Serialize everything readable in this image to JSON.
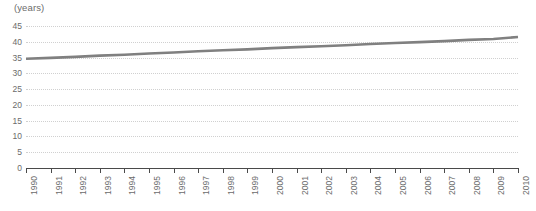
{
  "chart_data": {
    "type": "line",
    "title": "",
    "subtitle": "",
    "xlabel": "",
    "ylabel": "(years)",
    "unit_label": "(years)",
    "grid": true,
    "legend": false,
    "legend_position": "none",
    "xlim": [
      1990,
      2010
    ],
    "ylim": [
      0,
      45
    ],
    "ytick_labels": [
      "0",
      "5",
      "10",
      "15",
      "20",
      "25",
      "30",
      "35",
      "40",
      "45"
    ],
    "yticks": [
      0,
      5,
      10,
      15,
      20,
      25,
      30,
      35,
      40,
      45
    ],
    "categories": [
      "1990",
      "1991",
      "1992",
      "1993",
      "1994",
      "1995",
      "1996",
      "1997",
      "1998",
      "1999",
      "2000",
      "2001",
      "2002",
      "2003",
      "2004",
      "2005",
      "2006",
      "2007",
      "2008",
      "2009",
      "2010"
    ],
    "x": [
      1990,
      1991,
      1992,
      1993,
      1994,
      1995,
      1996,
      1997,
      1998,
      1999,
      2000,
      2001,
      2002,
      2003,
      2004,
      2005,
      2006,
      2007,
      2008,
      2009,
      2010
    ],
    "series": [
      {
        "name": "Average age",
        "color": "#808080",
        "values": [
          34.6,
          34.9,
          35.2,
          35.6,
          35.9,
          36.3,
          36.6,
          37.0,
          37.3,
          37.6,
          38.0,
          38.3,
          38.6,
          38.9,
          39.3,
          39.6,
          39.9,
          40.2,
          40.6,
          40.9,
          41.5
        ]
      }
    ]
  },
  "colors": {
    "series_line": "#808080",
    "axis": "#4a4a4a",
    "gridline": "#d0d0d0",
    "text": "#6b6b6b",
    "background": "#ffffff"
  }
}
